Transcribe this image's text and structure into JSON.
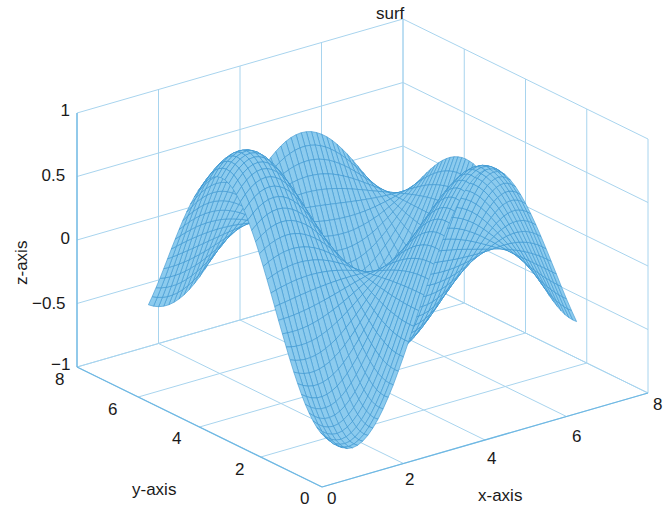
{
  "chart_data": {
    "type": "surface",
    "title": "surf",
    "xlabel": "x-axis",
    "ylabel": "y-axis",
    "zlabel": "z-axis",
    "xlim": [
      0,
      8
    ],
    "ylim": [
      0,
      8
    ],
    "zlim": [
      -1,
      1
    ],
    "xticks": [
      "0",
      "2",
      "4",
      "6",
      "8"
    ],
    "yticks": [
      "0",
      "2",
      "4",
      "6",
      "8"
    ],
    "zticks": [
      "-1",
      "-0.5",
      "0",
      "0.5",
      "1"
    ],
    "grid": true,
    "mesh": {
      "description": "wavy surface z = sin(x)*cos(y/2) style, domain approx x in [1,7], y in [1.5,6.5]",
      "x_range": [
        1.0,
        7.0
      ],
      "y_range": [
        1.0,
        7.0
      ],
      "peaks": [
        {
          "x": 1.6,
          "y": 5.0,
          "z": 0.78
        },
        {
          "x": 4.8,
          "y": 6.2,
          "z": 0.82
        }
      ],
      "troughs": [
        {
          "x": 1.0,
          "y": 4.0,
          "z": -1.0
        },
        {
          "x": 3.0,
          "y": 1.4,
          "z": -0.95
        }
      ]
    },
    "surface_color": "#4aa8e0",
    "edge_color": "#3a95d0",
    "axis_color": "#6fb8e3",
    "grid_color": "#a8d4ee"
  },
  "labels": {
    "title": "surf",
    "xlabel": "x-axis",
    "ylabel": "y-axis",
    "zlabel": "z-axis"
  }
}
